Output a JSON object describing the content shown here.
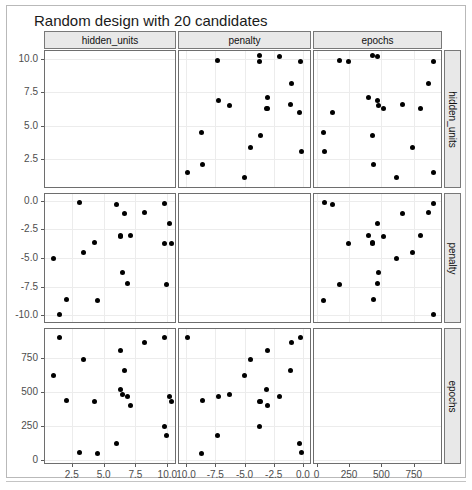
{
  "title": "Random design with 20 candidates",
  "strips": {
    "top": [
      "hidden_units",
      "penalty",
      "epochs"
    ],
    "right": [
      "hidden_units",
      "penalty",
      "epochs"
    ]
  },
  "axes": {
    "hidden_units": {
      "label": "hidden_units",
      "ticks": [
        2.5,
        5.0,
        7.5,
        10.0
      ],
      "tick_labels": [
        "2.5",
        "5.0",
        "7.5",
        "10.0"
      ],
      "range": [
        0.4,
        10.6
      ]
    },
    "penalty": {
      "label": "penalty",
      "ticks": [
        -10.0,
        -7.5,
        -5.0,
        -2.5,
        0.0
      ],
      "tick_labels": [
        "-10.0",
        "-7.5",
        "-5.0",
        "-2.5",
        "0.0"
      ],
      "range": [
        -10.6,
        0.6
      ]
    },
    "epochs": {
      "label": "epochs",
      "ticks": [
        0,
        250,
        500,
        750
      ],
      "tick_labels": [
        "0",
        "250",
        "500",
        "750"
      ],
      "range": [
        -20,
        960
      ]
    }
  },
  "chart_data": {
    "type": "scatter",
    "title": "Random design with 20 candidates",
    "plot_kind": "scatterplot-matrix",
    "variables": [
      "hidden_units",
      "penalty",
      "epochs"
    ],
    "n_points": 20,
    "grid": true,
    "legend": "none",
    "points": [
      {
        "hidden_units": 9.8,
        "penalty": -0.2,
        "epochs": 900
      },
      {
        "hidden_units": 6.0,
        "penalty": -0.3,
        "epochs": 120
      },
      {
        "hidden_units": 3.1,
        "penalty": -0.1,
        "epochs": 60
      },
      {
        "hidden_units": 8.2,
        "penalty": -1.0,
        "epochs": 860
      },
      {
        "hidden_units": 6.6,
        "penalty": -1.1,
        "epochs": 660
      },
      {
        "hidden_units": 10.2,
        "penalty": -2.0,
        "epochs": 470
      },
      {
        "hidden_units": 6.3,
        "penalty": -3.0,
        "epochs": 800
      },
      {
        "hidden_units": 6.3,
        "penalty": -3.1,
        "epochs": 520
      },
      {
        "hidden_units": 7.1,
        "penalty": -3.0,
        "epochs": 400
      },
      {
        "hidden_units": 4.3,
        "penalty": -3.6,
        "epochs": 430
      },
      {
        "hidden_units": 9.8,
        "penalty": -3.7,
        "epochs": 250
      },
      {
        "hidden_units": 10.3,
        "penalty": -3.7,
        "epochs": 430
      },
      {
        "hidden_units": 3.4,
        "penalty": -4.5,
        "epochs": 740
      },
      {
        "hidden_units": 1.1,
        "penalty": -5.0,
        "epochs": 620
      },
      {
        "hidden_units": 6.5,
        "penalty": -6.3,
        "epochs": 480
      },
      {
        "hidden_units": 6.9,
        "penalty": -7.2,
        "epochs": 470
      },
      {
        "hidden_units": 9.9,
        "penalty": -7.3,
        "epochs": 180
      },
      {
        "hidden_units": 2.1,
        "penalty": -8.6,
        "epochs": 440
      },
      {
        "hidden_units": 4.5,
        "penalty": -8.7,
        "epochs": 50
      },
      {
        "hidden_units": 1.5,
        "penalty": -9.9,
        "epochs": 900
      }
    ],
    "panels": [
      {
        "row": 0,
        "col": 0,
        "x": null,
        "y": "hidden_units",
        "empty": true
      },
      {
        "row": 0,
        "col": 1,
        "x": "penalty",
        "y": "hidden_units",
        "empty": false
      },
      {
        "row": 0,
        "col": 2,
        "x": "epochs",
        "y": "hidden_units",
        "empty": false
      },
      {
        "row": 1,
        "col": 0,
        "x": "hidden_units",
        "y": "penalty",
        "empty": false
      },
      {
        "row": 1,
        "col": 1,
        "x": null,
        "y": "penalty",
        "empty": true
      },
      {
        "row": 1,
        "col": 2,
        "x": "epochs",
        "y": "penalty",
        "empty": false
      },
      {
        "row": 2,
        "col": 0,
        "x": "hidden_units",
        "y": "epochs",
        "empty": false
      },
      {
        "row": 2,
        "col": 1,
        "x": "penalty",
        "y": "epochs",
        "empty": false
      },
      {
        "row": 2,
        "col": 2,
        "x": null,
        "y": "epochs",
        "empty": true
      }
    ],
    "y_tick_labels_by_row": [
      [
        "10.0",
        "7.5",
        "5.0",
        "2.5"
      ],
      [
        "0.0",
        "-2.5",
        "-5.0",
        "-7.5",
        "-10.0"
      ],
      [
        "750",
        "500",
        "250",
        "0"
      ]
    ],
    "x_tick_labels_by_col": [
      [
        "2.5",
        "5.0",
        "7.5",
        "10.0"
      ],
      [
        "10.0",
        "-7.5",
        "-5.0",
        "-2.5",
        "0.0"
      ],
      [
        "0",
        "250",
        "500",
        "750"
      ]
    ]
  },
  "colors": {
    "point": "#000000",
    "panel_border": "#6e6e6e",
    "strip_fill": "#e8e8e8",
    "grid": "#ececec",
    "text": "#4d4d4d",
    "frame": "#b9b9b9"
  }
}
